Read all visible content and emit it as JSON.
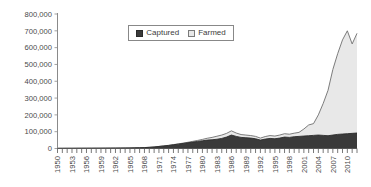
{
  "chart_data": {
    "type": "area",
    "stacked": true,
    "title": "",
    "subtitle": "",
    "xlabel": "",
    "ylabel": "",
    "grid": false,
    "legend_position": "top-center",
    "xlim": [
      1950,
      2012
    ],
    "ylim": [
      0,
      800000
    ],
    "ytick_values": [
      0,
      100000,
      200000,
      300000,
      400000,
      500000,
      600000,
      700000,
      800000
    ],
    "ytick_labels": [
      "0",
      "100,000",
      "200,000",
      "300,000",
      "400,000",
      "500,000",
      "600,000",
      "700,000",
      "800,000"
    ],
    "xtick_labels": [
      "1950",
      "1953",
      "1956",
      "1959",
      "1962",
      "1965",
      "1968",
      "1971",
      "1974",
      "1977",
      "1980",
      "1983",
      "1986",
      "1989",
      "1992",
      "1995",
      "1998",
      "2001",
      "2004",
      "2007",
      "2010"
    ],
    "xtick_step": 3,
    "minor_xticks_every": 1,
    "x": [
      1950,
      1951,
      1952,
      1953,
      1954,
      1955,
      1956,
      1957,
      1958,
      1959,
      1960,
      1961,
      1962,
      1963,
      1964,
      1965,
      1966,
      1967,
      1968,
      1969,
      1970,
      1971,
      1972,
      1973,
      1974,
      1975,
      1976,
      1977,
      1978,
      1979,
      1980,
      1981,
      1982,
      1983,
      1984,
      1985,
      1986,
      1987,
      1988,
      1989,
      1990,
      1991,
      1992,
      1993,
      1994,
      1995,
      1996,
      1997,
      1998,
      1999,
      2000,
      2001,
      2002,
      2003,
      2004,
      2005,
      2006,
      2007,
      2008,
      2009,
      2010,
      2011,
      2012
    ],
    "series": [
      {
        "name": "Captured",
        "color": "#3a3a3a",
        "values": [
          1200,
          1300,
          1400,
          1500,
          1600,
          1700,
          1800,
          1900,
          2000,
          2100,
          2300,
          2500,
          2700,
          2900,
          3200,
          3500,
          4000,
          4600,
          5400,
          7000,
          9000,
          12000,
          15000,
          18000,
          22000,
          26000,
          30000,
          34000,
          38000,
          42000,
          46000,
          50000,
          52000,
          55000,
          60000,
          68000,
          80000,
          72000,
          66000,
          64000,
          62000,
          58000,
          50000,
          56000,
          60000,
          58000,
          62000,
          68000,
          66000,
          70000,
          72000,
          74000,
          76000,
          78000,
          80000,
          78000,
          76000,
          80000,
          84000,
          86000,
          88000,
          90000,
          92000
        ],
        "units": "tonnes"
      },
      {
        "name": "Farmed",
        "color": "#e8e8e8",
        "values": [
          0,
          0,
          0,
          0,
          0,
          0,
          0,
          0,
          0,
          0,
          0,
          0,
          0,
          0,
          0,
          0,
          0,
          0,
          0,
          0,
          200,
          400,
          600,
          900,
          1200,
          1600,
          2000,
          3000,
          4500,
          6000,
          8000,
          11000,
          14000,
          18000,
          20000,
          22000,
          25000,
          20000,
          17000,
          16000,
          15000,
          14000,
          12000,
          15000,
          17000,
          16000,
          18000,
          20000,
          19000,
          21000,
          24000,
          42000,
          64000,
          70000,
          120000,
          190000,
          270000,
          390000,
          480000,
          560000,
          612000,
          532000,
          593000
        ],
        "units": "tonnes"
      }
    ],
    "totals_note": "Stacked total peaks near 700,000 around 2010",
    "annotations": []
  },
  "legend": {
    "entries": [
      {
        "label": "Captured",
        "swatch": "captured"
      },
      {
        "label": "Farmed",
        "swatch": "farmed"
      }
    ]
  }
}
